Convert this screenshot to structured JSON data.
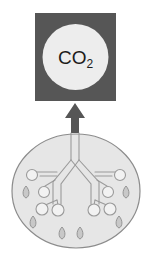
{
  "diagram": {
    "gas_box": {
      "label_main": "CO",
      "label_subscript": "2",
      "box_fill": "#565656",
      "circle_fill": "#ededed",
      "text_color": "#1c1c1c",
      "box": {
        "x": 35,
        "y": 13,
        "width": 81,
        "height": 88
      },
      "circle": {
        "cx": 75.5,
        "cy": 57,
        "r": 33
      }
    },
    "arrow": {
      "name": "exhalation-arrow",
      "direction": "up",
      "fill": "#565656",
      "points": "75,103 65,118 71,118 71,133 79,133 79,118 85,118"
    },
    "lung": {
      "outline_color": "#8c8c8c",
      "fill": "#e6e6e6",
      "ellipse": {
        "cx": 76,
        "cy": 191,
        "rx": 64,
        "ry": 57
      },
      "airway_fill": "#f2f2f2",
      "airway_stroke": "#9a9a9a",
      "alveoli_fill": "#f2f2f2",
      "alveoli_stroke": "#9a9a9a",
      "alveoli": [
        {
          "cx": 32,
          "cy": 175,
          "r": 5.5
        },
        {
          "cx": 44,
          "cy": 192,
          "r": 5.5
        },
        {
          "cx": 42,
          "cy": 209,
          "r": 6.0
        },
        {
          "cx": 58,
          "cy": 210,
          "r": 6.0
        },
        {
          "cx": 94,
          "cy": 210,
          "r": 6.0
        },
        {
          "cx": 110,
          "cy": 209,
          "r": 6.0
        },
        {
          "cx": 108,
          "cy": 192,
          "r": 5.5
        },
        {
          "cx": 120,
          "cy": 175,
          "r": 5.5
        }
      ],
      "droplets_fill": "#c8c8c8",
      "droplets_stroke": "#8c8c8c",
      "droplets": [
        {
          "cx": 26,
          "cy": 192
        },
        {
          "cx": 126,
          "cy": 192
        },
        {
          "cx": 33,
          "cy": 222
        },
        {
          "cx": 119,
          "cy": 222
        },
        {
          "cx": 62,
          "cy": 233
        },
        {
          "cx": 80,
          "cy": 233
        }
      ]
    }
  }
}
